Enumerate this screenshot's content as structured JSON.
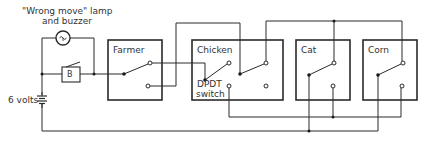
{
  "title": {
    "line1": "\"Wrong move\" lamp",
    "line2": "and buzzer"
  },
  "battery": {
    "label": "6 volts"
  },
  "buzzer": {
    "label": "B"
  },
  "boxes": [
    {
      "id": "farmer",
      "label": "Farmer"
    },
    {
      "id": "chicken",
      "label": "Chicken",
      "sublabel1": "DPDT",
      "sublabel2": "switch"
    },
    {
      "id": "cat",
      "label": "Cat"
    },
    {
      "id": "corn",
      "label": "Corn"
    }
  ],
  "colors": {
    "line": "#2a2a2a",
    "background": "#ffffff"
  }
}
